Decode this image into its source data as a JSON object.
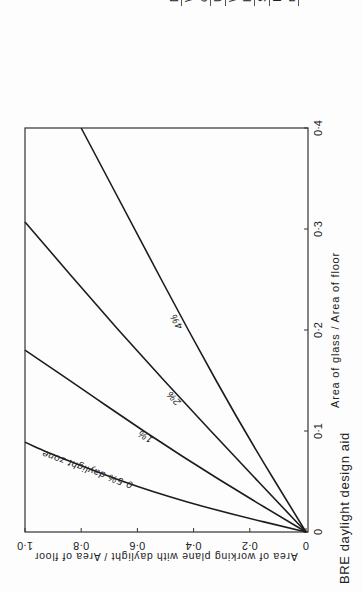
{
  "caption": "BRE daylight design aid",
  "conditions_table": {
    "rows": [
      {
        "label": "Daylight",
        "value": "D"
      },
      {
        "label": "Windows on",
        "value": ""
      },
      {
        "label": "one wall",
        "value": ""
      },
      {
        "label": "Unobstructed",
        "value": ""
      },
      {
        "label": "Window",
        "value": "1·8"
      },
      {
        "label": "height",
        "value": "(metres"
      },
      {
        "label": "Single clear glass",
        "value": ""
      },
      {
        "label": "Internal wall",
        "value": ""
      },
      {
        "label": "reflectance",
        "value": "0·4"
      }
    ]
  },
  "chart_data": {
    "type": "line",
    "title": "BRE daylight design aid",
    "xlabel": "Area of glass / Area of floor",
    "ylabel": "Area of working plane with daylight / Area of floor",
    "xlim": [
      0,
      0.4
    ],
    "ylim": [
      0,
      1.0
    ],
    "x_ticks": [
      "0",
      "0·1",
      "0·2",
      "0·3",
      "0·4"
    ],
    "y_ticks": [
      "0",
      "0·2",
      "0·4",
      "0·6",
      "0·8",
      "1·0"
    ],
    "grid": false,
    "rotation": "figure printed rotated 90° counter-clockwise",
    "series": [
      {
        "name": "0·5% daylight zone",
        "label": "0·5% daylight zone",
        "x": [
          0,
          0.02,
          0.04,
          0.06,
          0.08,
          0.089
        ],
        "y": [
          0,
          0.3,
          0.55,
          0.75,
          0.93,
          1.0
        ]
      },
      {
        "name": "1%",
        "label": "1%",
        "x": [
          0,
          0.05,
          0.1,
          0.15,
          0.18
        ],
        "y": [
          0,
          0.3,
          0.58,
          0.84,
          1.0
        ]
      },
      {
        "name": "2%",
        "label": "2%",
        "x": [
          0,
          0.1,
          0.2,
          0.307
        ],
        "y": [
          0,
          0.34,
          0.67,
          1.0
        ]
      },
      {
        "name": "4%",
        "label": "4%",
        "x": [
          0,
          0.1,
          0.2,
          0.3,
          0.4
        ],
        "y": [
          0,
          0.22,
          0.42,
          0.61,
          0.8
        ]
      }
    ]
  }
}
